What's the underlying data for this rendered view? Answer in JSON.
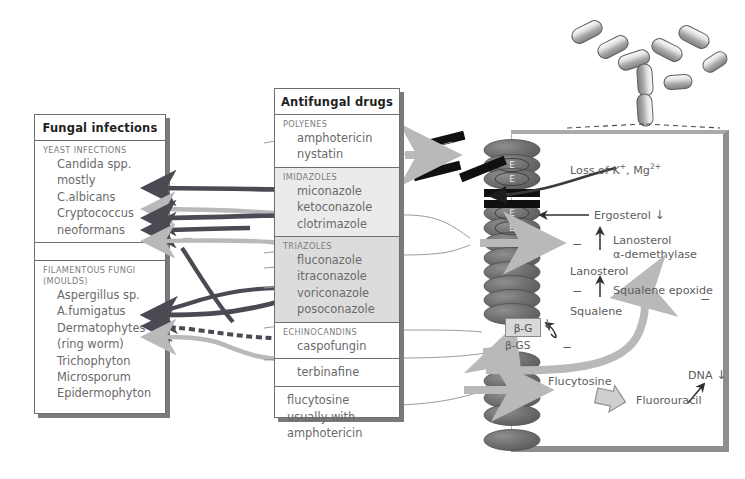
{
  "figure": {
    "kind": "antifungal-drugs-mechanism-diagram",
    "background": "#ffffff"
  },
  "colors": {
    "dark_arrow": "#4a4a52",
    "light_arrow": "#b9b9b9",
    "membrane_lipid": "#6e6e6e",
    "pore_bar": "#111111",
    "box_border": "#6f6f6f",
    "shadow": "#7a7a7a",
    "triazole_band": "#dcdcdc",
    "imidazole_band": "#ebebeb",
    "text": "#5d5d5d",
    "title_text": "#1f1f1f"
  },
  "infections_panel": {
    "title": "Fungal infections",
    "sections": [
      {
        "header": "YEAST INFECTIONS",
        "items": [
          "Candida spp.",
          "mostly",
          "C.albicans",
          "Cryptococcus",
          "neoformans"
        ]
      },
      {
        "header": "",
        "items": []
      },
      {
        "header_line1": "FILAMENTOUS FUNGI",
        "header_line2": "(MOULDS)",
        "items": [
          "Aspergillus sp.",
          "A.fumigatus",
          "Dermatophytes",
          "(ring worm)",
          "Trichophyton",
          "Microsporum",
          "Epidermophyton"
        ]
      }
    ]
  },
  "drugs_panel": {
    "title": "Antifungal drugs",
    "sections": [
      {
        "header": "POLYENES",
        "shade": "none",
        "items": [
          "amphotericin",
          "nystatin"
        ]
      },
      {
        "header": "IMIDAZOLES",
        "shade": "light",
        "items": [
          "miconazole",
          "ketoconazole",
          "clotrimazole"
        ]
      },
      {
        "header": "TRIAZOLES",
        "shade": "dark",
        "items": [
          "fluconazole",
          "itraconazole",
          "voriconazole",
          "posoconazole"
        ]
      },
      {
        "header": "ECHINOCANDINS",
        "shade": "none",
        "items": [
          "caspofungin"
        ]
      },
      {
        "header": "",
        "shade": "none",
        "items": [
          "terbinafine"
        ]
      },
      {
        "header": "",
        "shade": "none",
        "items": [
          "flucytosine",
          "usually with",
          "amphotericin"
        ]
      }
    ]
  },
  "cell_panel": {
    "membrane_marker": "E",
    "annotations": {
      "loss_ions": "Loss of K+, Mg2+",
      "loss_ions_plain": "Loss of K",
      "ergosterol": "Ergosterol",
      "ergosterol_arrow": "↓",
      "lanosterol_enzyme_l1": "Lanosterol",
      "lanosterol_enzyme_l2": "α-demethylase",
      "lanosterol": "Lanosterol",
      "squalene_epoxide": "Squalene epoxide",
      "squalene": "Squalene",
      "beta_g": "β-G",
      "beta_gs": "β-GS",
      "flucytosine": "Flucytosine",
      "fluorouracil": "Fluorouracil",
      "dna": "DNA",
      "dna_arrow": "↓",
      "minus": "−"
    }
  }
}
